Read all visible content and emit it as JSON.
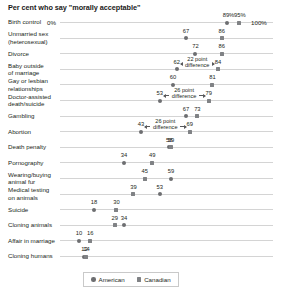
{
  "chart_title": "Per cent who say \"morally acceptable\"",
  "axis": {
    "zero_label": "0%",
    "hundred_label": "100%",
    "min": 0,
    "max": 100
  },
  "legend": {
    "position": "bottom-center",
    "entries": [
      {
        "name": "American",
        "marker": "circle-marker",
        "color": "#6d6e71"
      },
      {
        "name": "Canadian",
        "marker": "square-marker",
        "color": "#808285"
      }
    ]
  },
  "annotations": [
    {
      "text": "22 point\ndifference",
      "row": "Baby outside of marriage"
    },
    {
      "text": "26 point\ndifference",
      "row": "Doctor-assisted death/suicide"
    },
    {
      "text": "26 point\ndifference",
      "row": "Abortion"
    }
  ],
  "chart_data": {
    "type": "scatter",
    "title": "Per cent who say \"morally acceptable\"",
    "xlabel": "",
    "ylabel": "",
    "xlim": [
      0,
      100
    ],
    "grid": false,
    "legend_position": "bottom-center",
    "categories": [
      "Birth control",
      "Unmarried sex (heterosexual)",
      "Divorce",
      "Baby outside of marriage",
      "Gay or lesbian relationships",
      "Doctor-assisted death/suicide",
      "Gambling",
      "Abortion",
      "Death penalty",
      "Pornography",
      "Wearing/buying animal fur",
      "Medical testing on animals",
      "Suicide",
      "Cloning animals",
      "Affair in marriage",
      "Cloning humans"
    ],
    "series": [
      {
        "name": "American",
        "marker": "circle",
        "color": "#6d6e71",
        "values": [
          89,
          67,
          72,
          62,
          60,
          53,
          67,
          43,
          58,
          34,
          59,
          53,
          18,
          34,
          10,
          13
        ]
      },
      {
        "name": "Canadian",
        "marker": "square",
        "color": "#808285",
        "values": [
          95,
          86,
          86,
          84,
          81,
          79,
          73,
          69,
          59,
          49,
          45,
          39,
          30,
          29,
          16,
          14
        ]
      }
    ]
  },
  "rows": [
    {
      "label": "Birth control",
      "label_lines": [
        "Birth control"
      ],
      "american": 89,
      "canadian": 95,
      "american_display": "89%",
      "canadian_display": "95%",
      "has_zero_label": true,
      "has_hundred_label": true
    },
    {
      "label": "Unmarried sex (heterosexual)",
      "label_lines": [
        "Unmarried sex",
        "(heterosexual)"
      ],
      "american": 67,
      "canadian": 86,
      "american_display": "67",
      "canadian_display": "86"
    },
    {
      "label": "Divorce",
      "label_lines": [
        "Divorce"
      ],
      "american": 72,
      "canadian": 86,
      "american_display": "72",
      "canadian_display": "86"
    },
    {
      "label": "Baby outside of marriage",
      "label_lines": [
        "Baby outside",
        "of marriage"
      ],
      "american": 62,
      "canadian": 84,
      "american_display": "62",
      "canadian_display": "84",
      "annotation": "22 point\ndifference"
    },
    {
      "label": "Gay or lesbian relationships",
      "label_lines": [
        "Gay or lesbian",
        "relationships"
      ],
      "american": 60,
      "canadian": 81,
      "american_display": "60",
      "canadian_display": "81"
    },
    {
      "label": "Doctor-assisted death/suicide",
      "label_lines": [
        "Doctor-assisted",
        "death/suicide"
      ],
      "american": 53,
      "canadian": 79,
      "american_display": "53",
      "canadian_display": "79",
      "annotation": "26 point\ndifference"
    },
    {
      "label": "Gambling",
      "label_lines": [
        "Gambling"
      ],
      "american": 67,
      "canadian": 73,
      "american_display": "67",
      "canadian_display": "73"
    },
    {
      "label": "Abortion",
      "label_lines": [
        "Abortion"
      ],
      "american": 43,
      "canadian": 69,
      "american_display": "43",
      "canadian_display": "69",
      "annotation": "26 point\ndifference"
    },
    {
      "label": "Death penalty",
      "label_lines": [
        "Death penalty"
      ],
      "american": 58,
      "canadian": 59,
      "american_display": "58",
      "canadian_display": "59"
    },
    {
      "label": "Pornography",
      "label_lines": [
        "Pornography"
      ],
      "american": 34,
      "canadian": 49,
      "american_display": "34",
      "canadian_display": "49"
    },
    {
      "label": "Wearing/buying animal fur",
      "label_lines": [
        "Wearing/buying",
        "animal fur"
      ],
      "american": 59,
      "canadian": 45,
      "american_display": "59",
      "canadian_display": "45"
    },
    {
      "label": "Medical testing on animals",
      "label_lines": [
        "Medical testing",
        "on animals"
      ],
      "american": 53,
      "canadian": 39,
      "american_display": "53",
      "canadian_display": "39"
    },
    {
      "label": "Suicide",
      "label_lines": [
        "Suicide"
      ],
      "american": 18,
      "canadian": 30,
      "american_display": "18",
      "canadian_display": "30"
    },
    {
      "label": "Cloning animals",
      "label_lines": [
        "Cloning animals"
      ],
      "american": 34,
      "canadian": 29,
      "american_display": "34",
      "canadian_display": "29"
    },
    {
      "label": "Affair in marriage",
      "label_lines": [
        "Affair in marriage"
      ],
      "american": 10,
      "canadian": 16,
      "american_display": "10",
      "canadian_display": "16"
    },
    {
      "label": "Cloning humans",
      "label_lines": [
        "Cloning humans"
      ],
      "american": 13,
      "canadian": 14,
      "american_display": "13",
      "canadian_display": "14"
    }
  ]
}
